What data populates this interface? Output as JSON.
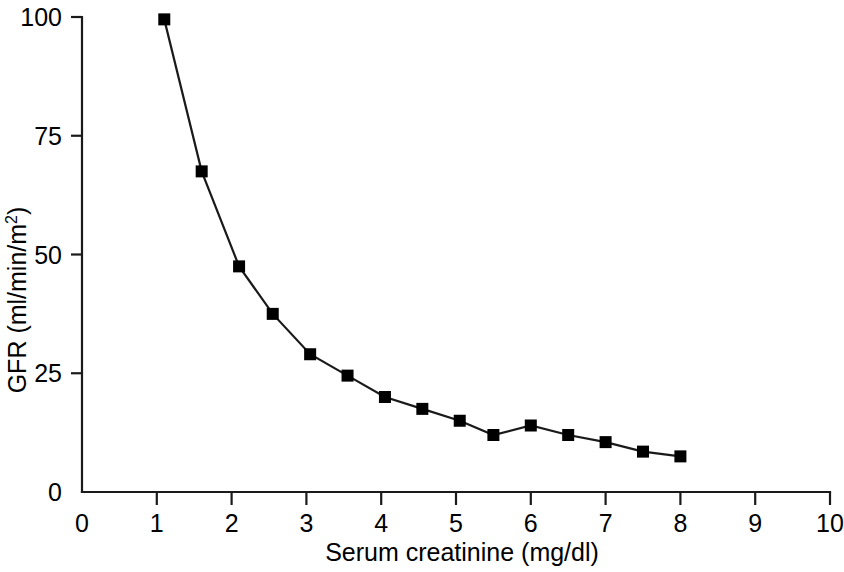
{
  "chart_data": {
    "type": "line",
    "title": "",
    "xlabel": "Serum creatinine (mg/dl)",
    "ylabel": "GFR  (ml/min/m2)",
    "ylabel_base": "GFR  (ml/min/m",
    "ylabel_superscript": "2",
    "ylabel_close": ")",
    "xlim": [
      0,
      10
    ],
    "ylim": [
      0,
      100
    ],
    "xticks": [
      0,
      1,
      2,
      3,
      4,
      5,
      6,
      7,
      8,
      9,
      10
    ],
    "xtick_labels": [
      "0",
      "1",
      "2",
      "3",
      "4",
      "5",
      "6",
      "7",
      "8",
      "9",
      "10"
    ],
    "yticks": [
      0,
      25,
      50,
      75,
      100
    ],
    "ytick_labels": [
      "0",
      "25",
      "50",
      "75",
      "100"
    ],
    "grid": false,
    "legend": "none",
    "marker": "square",
    "marker_size_px": 12,
    "line_color": "#1a1a1a",
    "marker_color": "#000000",
    "x": [
      1.1,
      1.6,
      2.1,
      2.55,
      3.05,
      3.55,
      4.05,
      4.55,
      5.05,
      5.5,
      6.0,
      6.5,
      7.0,
      7.5,
      8.0
    ],
    "y": [
      99.5,
      67.5,
      47.5,
      37.5,
      29.0,
      24.5,
      20.0,
      17.5,
      15.0,
      12.0,
      14.0,
      12.0,
      10.5,
      8.5,
      7.5
    ],
    "points": [
      {
        "x": 1.1,
        "y": 99.5
      },
      {
        "x": 1.6,
        "y": 67.5
      },
      {
        "x": 2.1,
        "y": 47.5
      },
      {
        "x": 2.55,
        "y": 37.5
      },
      {
        "x": 3.05,
        "y": 29.0
      },
      {
        "x": 3.55,
        "y": 24.5
      },
      {
        "x": 4.05,
        "y": 20.0
      },
      {
        "x": 4.55,
        "y": 17.5
      },
      {
        "x": 5.05,
        "y": 15.0
      },
      {
        "x": 5.5,
        "y": 12.0
      },
      {
        "x": 6.0,
        "y": 14.0
      },
      {
        "x": 6.5,
        "y": 12.0
      },
      {
        "x": 7.0,
        "y": 10.5
      },
      {
        "x": 7.5,
        "y": 8.5
      },
      {
        "x": 8.0,
        "y": 7.5
      }
    ]
  }
}
